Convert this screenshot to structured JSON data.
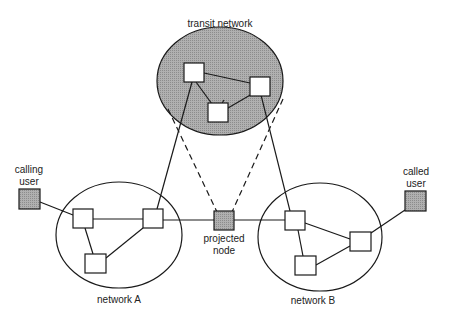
{
  "labels": {
    "transit": "transit network",
    "calling_user_l1": "calling",
    "calling_user_l2": "user",
    "called_user_l1": "called",
    "called_user_l2": "user",
    "projected_l1": "projected",
    "projected_l2": "node",
    "network_a": "network A",
    "network_b": "network B"
  },
  "colors": {
    "shaded": "#a8a8a8",
    "stroke": "#1a1a1a",
    "node_fill": "#ffffff"
  }
}
